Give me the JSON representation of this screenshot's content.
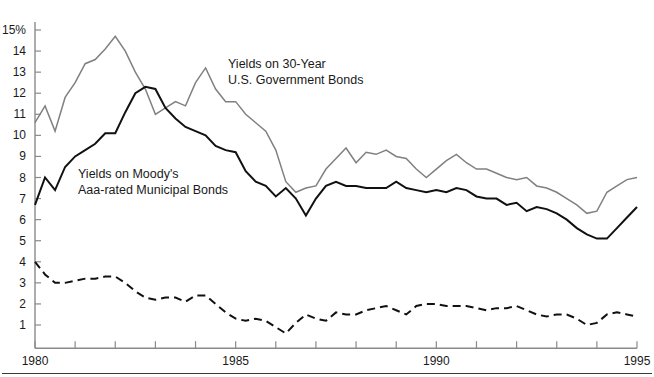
{
  "chart_data": {
    "type": "line",
    "title": "",
    "xlabel": "",
    "ylabel": "",
    "xlim": [
      1980,
      1995
    ],
    "ylim": [
      0,
      15
    ],
    "grid": false,
    "legend_position": "inline-annotation",
    "y_ticks": [
      1,
      2,
      3,
      4,
      5,
      6,
      7,
      8,
      9,
      10,
      11,
      12,
      13,
      14,
      15
    ],
    "y_tick_labels": [
      "1",
      "2",
      "3",
      "4",
      "5",
      "6",
      "7",
      "8",
      "9",
      "10",
      "11",
      "12",
      "13",
      "14",
      "15%"
    ],
    "x_ticks": [
      1980,
      1981,
      1982,
      1983,
      1984,
      1985,
      1986,
      1987,
      1988,
      1989,
      1990,
      1991,
      1992,
      1993,
      1994,
      1995
    ],
    "x_tick_labels_shown": [
      "1980",
      "1985",
      "1990",
      "1995"
    ],
    "x_tick_label_years": [
      1980,
      1985,
      1990,
      1995
    ],
    "series": [
      {
        "name": "Yields on 30-Year U.S. Government Bonds",
        "style": "solid",
        "color": "#808080",
        "width": 1.5,
        "x": [
          1980.0,
          1980.25,
          1980.5,
          1980.75,
          1981.0,
          1981.25,
          1981.5,
          1981.75,
          1982.0,
          1982.25,
          1982.5,
          1982.75,
          1983.0,
          1983.25,
          1983.5,
          1983.75,
          1984.0,
          1984.25,
          1984.5,
          1984.75,
          1985.0,
          1985.25,
          1985.5,
          1985.75,
          1986.0,
          1986.25,
          1986.5,
          1986.75,
          1987.0,
          1987.25,
          1987.5,
          1987.75,
          1988.0,
          1988.25,
          1988.5,
          1988.75,
          1989.0,
          1989.25,
          1989.5,
          1989.75,
          1990.0,
          1990.25,
          1990.5,
          1990.75,
          1991.0,
          1991.25,
          1991.5,
          1991.75,
          1992.0,
          1992.25,
          1992.5,
          1992.75,
          1993.0,
          1993.25,
          1993.5,
          1993.75,
          1994.0,
          1994.25,
          1994.5,
          1994.75,
          1995.0
        ],
        "y": [
          10.6,
          11.4,
          10.2,
          11.8,
          12.5,
          13.4,
          13.6,
          14.1,
          14.7,
          14.0,
          13.0,
          12.2,
          11.0,
          11.3,
          11.6,
          11.4,
          12.5,
          13.2,
          12.2,
          11.6,
          11.6,
          11.0,
          10.6,
          10.2,
          9.3,
          7.8,
          7.3,
          7.5,
          7.6,
          8.4,
          8.9,
          9.4,
          8.7,
          9.2,
          9.1,
          9.3,
          9.0,
          8.9,
          8.4,
          8.0,
          8.4,
          8.8,
          9.1,
          8.7,
          8.4,
          8.4,
          8.2,
          8.0,
          7.9,
          8.0,
          7.6,
          7.5,
          7.3,
          7.0,
          6.7,
          6.3,
          6.4,
          7.3,
          7.6,
          7.9,
          8.0
        ]
      },
      {
        "name": "Yields on Moody's Aaa-rated Municipal Bonds",
        "style": "solid",
        "color": "#111111",
        "width": 2.0,
        "x": [
          1980.0,
          1980.25,
          1980.5,
          1980.75,
          1981.0,
          1981.25,
          1981.5,
          1981.75,
          1982.0,
          1982.25,
          1982.5,
          1982.75,
          1983.0,
          1983.25,
          1983.5,
          1983.75,
          1984.0,
          1984.25,
          1984.5,
          1984.75,
          1985.0,
          1985.25,
          1985.5,
          1985.75,
          1986.0,
          1986.25,
          1986.5,
          1986.75,
          1987.0,
          1987.25,
          1987.5,
          1987.75,
          1988.0,
          1988.25,
          1988.5,
          1988.75,
          1989.0,
          1989.25,
          1989.5,
          1989.75,
          1990.0,
          1990.25,
          1990.5,
          1990.75,
          1991.0,
          1991.25,
          1991.5,
          1991.75,
          1992.0,
          1992.25,
          1992.5,
          1992.75,
          1993.0,
          1993.25,
          1993.5,
          1993.75,
          1994.0,
          1994.25,
          1994.5,
          1994.75,
          1995.0
        ],
        "y": [
          6.7,
          8.0,
          7.4,
          8.5,
          9.0,
          9.3,
          9.6,
          10.1,
          10.1,
          11.1,
          12.0,
          12.3,
          12.2,
          11.3,
          10.8,
          10.4,
          10.2,
          10.0,
          9.5,
          9.3,
          9.2,
          8.3,
          7.8,
          7.6,
          7.1,
          7.5,
          7.0,
          6.2,
          7.0,
          7.6,
          7.8,
          7.6,
          7.6,
          7.5,
          7.5,
          7.5,
          7.8,
          7.5,
          7.4,
          7.3,
          7.4,
          7.3,
          7.5,
          7.4,
          7.1,
          7.0,
          7.0,
          6.7,
          6.8,
          6.4,
          6.6,
          6.5,
          6.3,
          6.0,
          5.6,
          5.3,
          5.1,
          5.1,
          5.6,
          6.1,
          6.6
        ]
      },
      {
        "name": "Spread (Government minus Municipal)",
        "style": "dashed",
        "color": "#111111",
        "width": 2.0,
        "x": [
          1980.0,
          1980.25,
          1980.5,
          1980.75,
          1981.0,
          1981.25,
          1981.5,
          1981.75,
          1982.0,
          1982.25,
          1982.5,
          1982.75,
          1983.0,
          1983.25,
          1983.5,
          1983.75,
          1984.0,
          1984.25,
          1984.5,
          1984.75,
          1985.0,
          1985.25,
          1985.5,
          1985.75,
          1986.0,
          1986.25,
          1986.5,
          1986.75,
          1987.0,
          1987.25,
          1987.5,
          1987.75,
          1988.0,
          1988.25,
          1988.5,
          1988.75,
          1989.0,
          1989.25,
          1989.5,
          1989.75,
          1990.0,
          1990.25,
          1990.5,
          1990.75,
          1991.0,
          1991.25,
          1991.5,
          1991.75,
          1992.0,
          1992.25,
          1992.5,
          1992.75,
          1993.0,
          1993.25,
          1993.5,
          1993.75,
          1994.0,
          1994.25,
          1994.5,
          1994.75,
          1995.0
        ],
        "y": [
          4.0,
          3.4,
          3.0,
          3.0,
          3.1,
          3.2,
          3.2,
          3.3,
          3.3,
          3.0,
          2.6,
          2.3,
          2.2,
          2.3,
          2.3,
          2.1,
          2.4,
          2.4,
          2.0,
          1.6,
          1.3,
          1.2,
          1.3,
          1.2,
          0.9,
          0.6,
          1.1,
          1.5,
          1.3,
          1.2,
          1.6,
          1.5,
          1.5,
          1.7,
          1.8,
          1.9,
          1.7,
          1.5,
          1.9,
          2.0,
          2.0,
          1.9,
          1.9,
          1.9,
          1.8,
          1.7,
          1.8,
          1.8,
          1.9,
          1.7,
          1.5,
          1.4,
          1.5,
          1.5,
          1.3,
          1.0,
          1.1,
          1.5,
          1.6,
          1.5,
          1.4
        ]
      }
    ],
    "annotations": [
      {
        "id": "gov-bonds-label",
        "lines": [
          "Yields on 30-Year",
          "U.S. Government Bonds"
        ],
        "x_px": 228,
        "y_px": 68
      },
      {
        "id": "muni-bonds-label",
        "lines": [
          "Yields on Moody's",
          "Aaa-rated Municipal Bonds"
        ],
        "x_px": 78,
        "y_px": 178
      }
    ]
  },
  "axis": {
    "y_unit_label": "15%",
    "x_first_label": "1980",
    "x_last_label": "1995"
  },
  "colors": {
    "gov_line": "#808080",
    "muni_line": "#111111",
    "spread_line": "#111111",
    "axis": "#8a8a8a",
    "text": "#1a1a1a",
    "background": "#ffffff"
  }
}
